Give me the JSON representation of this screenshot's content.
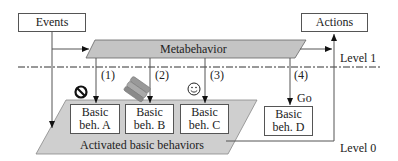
{
  "diagram": {
    "inputs": {
      "events": "Events",
      "actions": "Actions"
    },
    "metabehavior": {
      "label": "Metabehavior",
      "fill": "#c4c4c4"
    },
    "levels": {
      "level1": "Level 1",
      "level0": "Level 0"
    },
    "arrows": [
      "(1)",
      "(2)",
      "(3)",
      "(4)"
    ],
    "go_label": "Go",
    "activated_area": {
      "label": "Activated basic behaviors",
      "fill": "#cfcfcf"
    },
    "behaviors": [
      {
        "line1": "Basic",
        "line2": "beh. A",
        "icon": "no-entry-icon"
      },
      {
        "line1": "Basic",
        "line2": "beh. B",
        "icon": "batteries-icon"
      },
      {
        "line1": "Basic",
        "line2": "beh. C",
        "icon": "smiley-icon"
      },
      {
        "line1": "Basic",
        "line2": "beh. D",
        "icon": "go-label"
      }
    ]
  }
}
